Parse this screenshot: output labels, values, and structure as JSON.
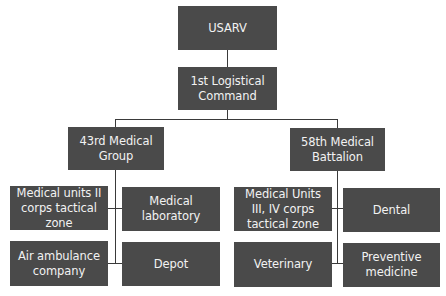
{
  "diagram": {
    "type": "org-chart",
    "box_color": "#4a4a4a",
    "text_color": "#f2f2f2",
    "line_color": "#3a3a3a",
    "nodes": {
      "root": {
        "label": "USARV"
      },
      "level1": {
        "label": "1st Logistical Command"
      },
      "group_left": {
        "label": "43rd Medical Group"
      },
      "group_right": {
        "label": "58th Medical Battalion"
      },
      "left_children": [
        {
          "label": "Medical units II corps tactical zone"
        },
        {
          "label": "Medical laboratory"
        },
        {
          "label": "Air ambulance company"
        },
        {
          "label": "Depot"
        }
      ],
      "right_children": [
        {
          "label": "Medical Units III, IV corps tactical zone"
        },
        {
          "label": "Dental"
        },
        {
          "label": "Veterinary"
        },
        {
          "label": "Preventive medicine"
        }
      ]
    }
  }
}
